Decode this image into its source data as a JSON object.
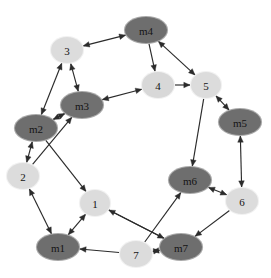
{
  "figure": {
    "type": "directed-graph",
    "width": 271,
    "height": 278,
    "background_color": "#ffffff"
  },
  "style": {
    "machine_node_color": "#6e6e6e",
    "job_node_color": "#d9d9d9",
    "node_text_color": "#141414",
    "edge_color": "#2b2b2b",
    "node_rx": 20,
    "node_ry": 13
  },
  "nodes": [
    {
      "id": "m4",
      "label": "m4",
      "x": 146,
      "y": 30,
      "kind": "machine",
      "color": "#6e6e6e",
      "rx": 21,
      "ry": 13
    },
    {
      "id": "n3",
      "label": "3",
      "x": 67,
      "y": 50,
      "kind": "job",
      "color": "#dcdcdc",
      "rx": 16,
      "ry": 13
    },
    {
      "id": "n4",
      "label": "4",
      "x": 158,
      "y": 85,
      "kind": "job",
      "color": "#d8d8d8",
      "rx": 16,
      "ry": 13
    },
    {
      "id": "n5",
      "label": "5",
      "x": 206,
      "y": 85,
      "kind": "job",
      "color": "#dcdcdc",
      "rx": 15,
      "ry": 13
    },
    {
      "id": "m3",
      "label": "m3",
      "x": 82,
      "y": 105,
      "kind": "machine",
      "color": "#707070",
      "rx": 21,
      "ry": 13
    },
    {
      "id": "m5",
      "label": "m5",
      "x": 240,
      "y": 122,
      "kind": "machine",
      "color": "#6e6e6e",
      "rx": 21,
      "ry": 13
    },
    {
      "id": "m2",
      "label": "m2",
      "x": 36,
      "y": 128,
      "kind": "machine",
      "color": "#6e6e6e",
      "rx": 21,
      "ry": 13
    },
    {
      "id": "n2",
      "label": "2",
      "x": 23,
      "y": 176,
      "kind": "job",
      "color": "#dcdcdc",
      "rx": 16,
      "ry": 13
    },
    {
      "id": "m6",
      "label": "m6",
      "x": 190,
      "y": 180,
      "kind": "machine",
      "color": "#6e6e6e",
      "rx": 21,
      "ry": 13
    },
    {
      "id": "n1",
      "label": "1",
      "x": 95,
      "y": 203,
      "kind": "job",
      "color": "#dcdcdc",
      "rx": 15,
      "ry": 13
    },
    {
      "id": "n6",
      "label": "6",
      "x": 242,
      "y": 201,
      "kind": "job",
      "color": "#dcdcdc",
      "rx": 16,
      "ry": 13
    },
    {
      "id": "m1",
      "label": "m1",
      "x": 58,
      "y": 247,
      "kind": "machine",
      "color": "#6e6e6e",
      "rx": 21,
      "ry": 13
    },
    {
      "id": "n7",
      "label": "7",
      "x": 136,
      "y": 254,
      "kind": "job",
      "color": "#dcdcdc",
      "rx": 16,
      "ry": 13
    },
    {
      "id": "m7",
      "label": "m7",
      "x": 181,
      "y": 247,
      "kind": "machine",
      "color": "#6e6e6e",
      "rx": 21,
      "ry": 13
    }
  ],
  "edges": [
    {
      "from": "n3",
      "to": "m4",
      "bidirectional": true
    },
    {
      "from": "m4",
      "to": "n4",
      "bidirectional": false
    },
    {
      "from": "m4",
      "to": "n5",
      "bidirectional": true
    },
    {
      "from": "n3",
      "to": "m3",
      "bidirectional": true
    },
    {
      "from": "m3",
      "to": "n4",
      "bidirectional": true
    },
    {
      "from": "n4",
      "to": "n5",
      "bidirectional": false
    },
    {
      "from": "n5",
      "to": "m5",
      "bidirectional": true
    },
    {
      "from": "n5",
      "to": "m6",
      "bidirectional": false
    },
    {
      "from": "m2",
      "to": "n3",
      "bidirectional": true
    },
    {
      "from": "m2",
      "to": "m3",
      "bidirectional": true
    },
    {
      "from": "m2",
      "to": "n2",
      "bidirectional": true
    },
    {
      "from": "n2",
      "to": "m3",
      "bidirectional": false
    },
    {
      "from": "m2",
      "to": "n1",
      "bidirectional": false
    },
    {
      "from": "n2",
      "to": "m1",
      "bidirectional": true
    },
    {
      "from": "n1",
      "to": "m1",
      "bidirectional": true
    },
    {
      "from": "m7",
      "to": "n1",
      "bidirectional": false
    },
    {
      "from": "n7",
      "to": "m1",
      "bidirectional": false
    },
    {
      "from": "n7",
      "to": "m7",
      "bidirectional": true
    },
    {
      "from": "n7",
      "to": "m6",
      "bidirectional": false
    },
    {
      "from": "n1",
      "to": "m7",
      "bidirectional": false
    },
    {
      "from": "m6",
      "to": "n6",
      "bidirectional": true
    },
    {
      "from": "n6",
      "to": "m7",
      "bidirectional": false
    },
    {
      "from": "m5",
      "to": "n6",
      "bidirectional": true
    }
  ]
}
